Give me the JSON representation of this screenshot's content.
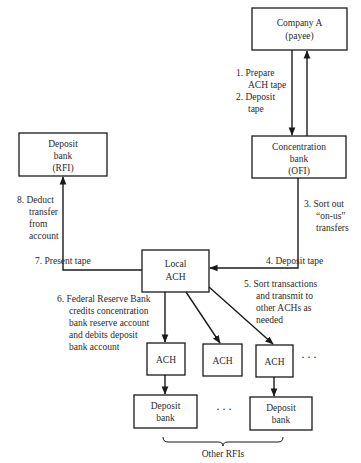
{
  "nodes": {
    "company_a": {
      "line1": "Company A",
      "line2": "(payee)"
    },
    "concentration_bank": {
      "line1": "Concentration",
      "line2": "bank",
      "line3": "(OFI)"
    },
    "deposit_bank_rfi": {
      "line1": "Deposit",
      "line2": "bank",
      "line3": "(RFI)"
    },
    "local_ach": {
      "line1": "Local",
      "line2": "ACH"
    },
    "ach_1": {
      "label": "ACH"
    },
    "ach_2": {
      "label": "ACH"
    },
    "ach_3": {
      "label": "ACH"
    },
    "deposit_bank_1": {
      "line1": "Deposit",
      "line2": "bank"
    },
    "deposit_bank_2": {
      "line1": "Deposit",
      "line2": "bank"
    }
  },
  "steps": {
    "step1": {
      "l1": "1.  Prepare",
      "l2": "ACH tape"
    },
    "step2": {
      "l1": "2.  Deposit",
      "l2": "tape"
    },
    "step3": {
      "l1": "3.  Sort out",
      "l2": "“on-us”",
      "l3": "transfers"
    },
    "step4": {
      "l1": "4.  Deposit tape"
    },
    "step5": {
      "l1": "5.  Sort transactions",
      "l2": "and transmit to",
      "l3": "other ACHs as",
      "l4": "needed"
    },
    "step6": {
      "l1": "6.  Federal Reserve Bank",
      "l2": "credits concentration",
      "l3": "bank reserve account",
      "l4": "and debits deposit",
      "l5": "bank account"
    },
    "step7": {
      "l1": "7.  Present tape"
    },
    "step8": {
      "l1": "8.  Deduct",
      "l2": "transfer",
      "l3": "from",
      "l4": "account"
    }
  },
  "ellipsis": {
    "ach_row": "···",
    "bank_row": "···"
  },
  "group_label": "Other RFIs"
}
